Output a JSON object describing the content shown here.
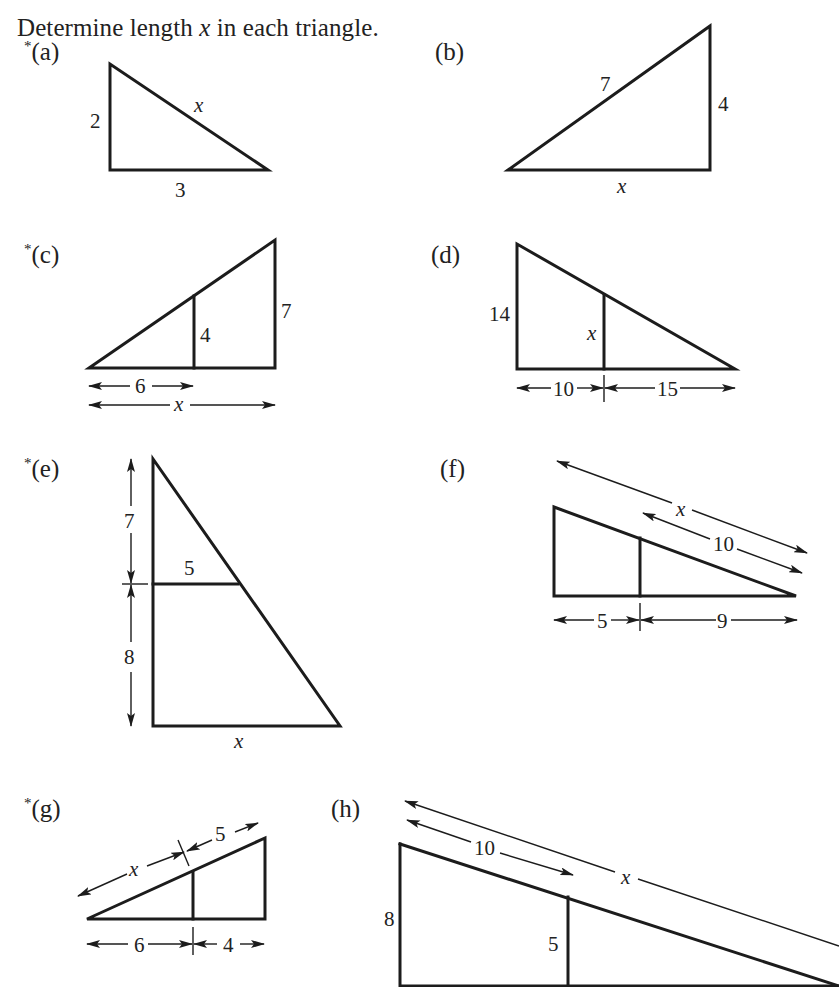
{
  "instruction": {
    "prefix": "Determine length ",
    "variable": "x",
    "suffix": " in each triangle."
  },
  "parts": [
    {
      "id": "a",
      "starred": true,
      "label": "(a)",
      "labels": {
        "vertical": "2",
        "base": "3",
        "hypotenuse": "x"
      }
    },
    {
      "id": "b",
      "starred": false,
      "label": "(b)",
      "labels": {
        "hypotenuse": "7",
        "vertical": "4",
        "base": "x"
      }
    },
    {
      "id": "c",
      "starred": true,
      "label": "(c)",
      "labels": {
        "inner_vertical": "4",
        "outer_vertical": "7",
        "inner_base": "6",
        "full_base": "x"
      }
    },
    {
      "id": "d",
      "starred": false,
      "label": "(d)",
      "labels": {
        "outer_vertical": "14",
        "inner_vertical": "x",
        "left_segment": "10",
        "right_segment": "15"
      }
    },
    {
      "id": "e",
      "starred": true,
      "label": "(e)",
      "labels": {
        "upper_height": "7",
        "lower_height": "8",
        "inner_width": "5",
        "base": "x"
      }
    },
    {
      "id": "f",
      "starred": false,
      "label": "(f)",
      "labels": {
        "full_hypotenuse": "x",
        "partial_hypotenuse": "10",
        "left_segment": "5",
        "right_segment": "9"
      }
    },
    {
      "id": "g",
      "starred": true,
      "label": "(g)",
      "labels": {
        "lower_hypotenuse": "x",
        "upper_hypotenuse": "5",
        "left_segment": "6",
        "right_segment": "4"
      }
    },
    {
      "id": "h",
      "starred": false,
      "label": "(h)",
      "labels": {
        "outer_vertical": "8",
        "inner_vertical": "5",
        "partial_hypotenuse": "10",
        "full_hypotenuse": "x"
      }
    }
  ],
  "star_symbol": "*"
}
